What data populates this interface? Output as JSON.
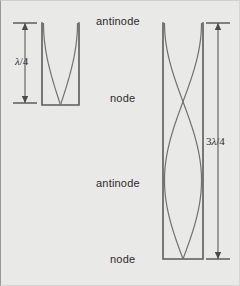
{
  "figure": {
    "type": "physics-diagram",
    "background_color": "#e9e9e7",
    "ink_color": "#5b5b5b",
    "text_color": "#2b2b2b",
    "width": 240,
    "height": 286
  },
  "center_labels": [
    {
      "text": "antinode",
      "x": 95,
      "y": 14
    },
    {
      "text": "node",
      "x": 109,
      "y": 91
    },
    {
      "text": "antinode",
      "x": 95,
      "y": 176
    },
    {
      "text": "node",
      "x": 109,
      "y": 252
    }
  ],
  "dimensions": [
    {
      "name": "quarter-wavelength",
      "label_prefix": "",
      "label_lambda": "λ",
      "label_suffix": "/4",
      "label_x": 14,
      "label_y": 54,
      "line_x": 24,
      "y_top": 22,
      "y_bottom": 102,
      "tick_half_width": 12
    },
    {
      "name": "three-quarter-wavelength",
      "label_prefix": "3",
      "label_lambda": "λ",
      "label_suffix": "/4",
      "label_x": 205,
      "label_y": 134,
      "line_x": 217,
      "y_top": 22,
      "y_bottom": 258,
      "tick_half_width": 12
    }
  ],
  "pipes": [
    {
      "name": "quarter-wave-pipe",
      "x_left": 41,
      "x_right": 78,
      "y_top": 22,
      "y_bottom": 104,
      "closed_end": "bottom",
      "open_end": "top",
      "harmonic": 1,
      "wavelengths_in_pipe": 0.25,
      "nodes_at": [
        104
      ],
      "antinodes_at": [
        22
      ]
    },
    {
      "name": "three-quarter-wave-pipe",
      "x_left": 162,
      "x_right": 202,
      "y_top": 22,
      "y_bottom": 258,
      "closed_end": "bottom",
      "open_end": "top",
      "harmonic": 3,
      "wavelengths_in_pipe": 0.75,
      "nodes_at": [
        101,
        258
      ],
      "antinodes_at": [
        22,
        180
      ]
    }
  ]
}
